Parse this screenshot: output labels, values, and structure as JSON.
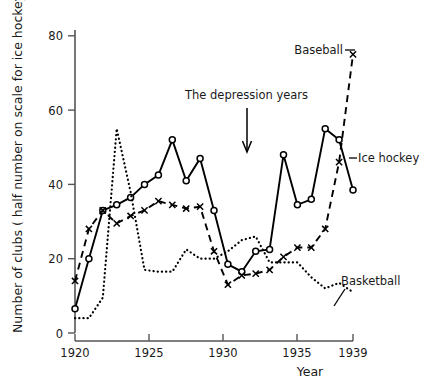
{
  "chart_data": {
    "type": "line",
    "title": "",
    "xlabel": "Year",
    "ylabel": "Number of clubs ( half number on scale for ice hockey)",
    "xlim": [
      1919,
      1939
    ],
    "ylim": [
      0,
      84
    ],
    "grid": false,
    "legend_position": "inline-annotations",
    "xticks": [
      1920,
      1925,
      1930,
      1935,
      1939
    ],
    "xticklabels": [
      "1920",
      "1925",
      "1930",
      "1935",
      "1939"
    ],
    "yticks": [
      0,
      20,
      40,
      60,
      80
    ],
    "yticklabels": [
      "0",
      "20",
      "40",
      "60",
      "80"
    ],
    "x": [
      1919,
      1920,
      1921,
      1922,
      1923,
      1924,
      1925,
      1926,
      1927,
      1928,
      1929,
      1930,
      1931,
      1932,
      1933,
      1934,
      1935,
      1936,
      1937,
      1938,
      1939
    ],
    "series": [
      {
        "name": "Ice hockey",
        "style": "solid",
        "marker": "circle",
        "values": [
          6.5,
          20,
          33,
          34.5,
          36.5,
          40,
          42.5,
          52,
          41,
          47,
          33,
          18.5,
          16.5,
          22,
          22.5,
          48,
          34.5,
          36,
          55,
          52,
          38.5
        ]
      },
      {
        "name": "Baseball",
        "style": "dashed",
        "marker": "x",
        "values": [
          14,
          28,
          33,
          29.5,
          31.5,
          33,
          35.5,
          34.5,
          33.5,
          34,
          22,
          13,
          15.5,
          16,
          17,
          20.5,
          23,
          23,
          28,
          46,
          75
        ]
      },
      {
        "name": "Basketball",
        "style": "dotted",
        "marker": "none",
        "values": [
          4,
          4,
          9.5,
          55,
          38,
          17,
          16.5,
          16.5,
          22.5,
          20,
          20,
          22,
          25,
          26,
          19,
          19,
          19,
          15,
          12,
          13.5,
          11
        ]
      }
    ],
    "annotations": [
      {
        "text": "The depression years",
        "kind": "arrow-note",
        "points_to_year": 1931.5
      },
      {
        "text": "Baseball",
        "kind": "series-label"
      },
      {
        "text": "Ice hockey",
        "kind": "series-label"
      },
      {
        "text": "Basketball",
        "kind": "series-label"
      }
    ]
  },
  "axes": {
    "ylabel": "Number of clubs ( half number on scale for ice hockey)",
    "xlabel": "Year",
    "xticklabels": [
      "1920",
      "1925",
      "1930",
      "1935",
      "1939"
    ],
    "yticklabels": [
      "0",
      "20",
      "40",
      "60",
      "80"
    ]
  },
  "labels": {
    "depression": "The depression years",
    "baseball": "Baseball",
    "ice_hockey": "Ice hockey",
    "basketball": "Basketball"
  },
  "colors": {
    "ink": "#000000",
    "axis": "#555555",
    "background": "#ffffff"
  }
}
